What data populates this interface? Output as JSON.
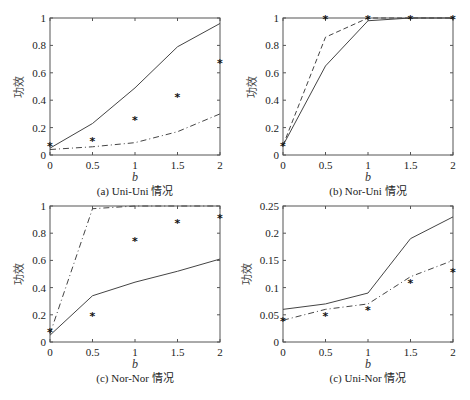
{
  "chart_data": [
    {
      "type": "line",
      "title": "(a) Uni-Uni 情况",
      "xlabel": "b",
      "ylabel": "功效",
      "xlim": [
        0,
        2
      ],
      "ylim": [
        0,
        1
      ],
      "xticks": [
        "0",
        "0.5",
        "1",
        "1.5",
        "2"
      ],
      "yticks": [
        "0",
        "0.2",
        "0.4",
        "0.6",
        "0.8",
        "1"
      ],
      "x": [
        0,
        0.5,
        1,
        1.5,
        2
      ],
      "series": [
        {
          "name": "solid",
          "style": "solid",
          "values": [
            0.05,
            0.23,
            0.49,
            0.79,
            0.96
          ]
        },
        {
          "name": "dash-dot",
          "style": "dashdot",
          "values": [
            0.04,
            0.06,
            0.09,
            0.17,
            0.3
          ]
        },
        {
          "name": "stars",
          "style": "marker",
          "values": [
            0.07,
            0.11,
            0.26,
            0.43,
            0.68
          ]
        }
      ]
    },
    {
      "type": "line",
      "title": "(b) Nor-Uni 情况",
      "xlabel": "b",
      "ylabel": "功效",
      "xlim": [
        0,
        2
      ],
      "ylim": [
        0,
        1
      ],
      "xticks": [
        "0",
        "0.5",
        "1",
        "1.5",
        "2"
      ],
      "yticks": [
        "0",
        "0.2",
        "0.4",
        "0.6",
        "0.8",
        "1"
      ],
      "x": [
        0,
        0.5,
        1,
        1.5,
        2
      ],
      "series": [
        {
          "name": "solid",
          "style": "solid",
          "values": [
            0.07,
            0.65,
            0.98,
            1.0,
            1.0
          ]
        },
        {
          "name": "dashed",
          "style": "dashed",
          "values": [
            0.07,
            0.86,
            1.0,
            1.0,
            1.0
          ]
        },
        {
          "name": "stars",
          "style": "marker",
          "values": [
            0.07,
            1.0,
            1.0,
            1.0,
            1.0
          ]
        }
      ]
    },
    {
      "type": "line",
      "title": "(c) Nor-Nor 情况",
      "xlabel": "b",
      "ylabel": "功效",
      "xlim": [
        0,
        2
      ],
      "ylim": [
        0,
        1
      ],
      "xticks": [
        "0",
        "0.5",
        "1",
        "1.5",
        "2"
      ],
      "yticks": [
        "0",
        "0.2",
        "0.4",
        "0.6",
        "0.8",
        "1"
      ],
      "x": [
        0,
        0.5,
        1,
        1.5,
        2
      ],
      "series": [
        {
          "name": "solid",
          "style": "solid",
          "values": [
            0.05,
            0.34,
            0.44,
            0.52,
            0.61
          ]
        },
        {
          "name": "dash-dot",
          "style": "dashdot",
          "values": [
            0.06,
            0.98,
            1.0,
            1.0,
            1.0
          ]
        },
        {
          "name": "stars",
          "style": "marker",
          "values": [
            0.08,
            0.2,
            0.75,
            0.88,
            0.92
          ]
        }
      ]
    },
    {
      "type": "line",
      "title": "(c) Uni-Nor 情况",
      "xlabel": "b",
      "ylabel": "功效",
      "xlim": [
        0,
        2
      ],
      "ylim": [
        0,
        0.25
      ],
      "xticks": [
        "0",
        "0.5",
        "1",
        "1.5",
        "2"
      ],
      "yticks": [
        "0",
        "0.05",
        "0.1",
        "0.15",
        "0.2",
        "0.25"
      ],
      "x": [
        0,
        0.5,
        1,
        1.5,
        2
      ],
      "series": [
        {
          "name": "solid",
          "style": "solid",
          "values": [
            0.06,
            0.07,
            0.09,
            0.19,
            0.23
          ]
        },
        {
          "name": "dash-dot",
          "style": "dashdot",
          "values": [
            0.04,
            0.06,
            0.07,
            0.12,
            0.15
          ]
        },
        {
          "name": "stars",
          "style": "marker",
          "values": [
            0.04,
            0.05,
            0.06,
            0.11,
            0.13
          ]
        }
      ]
    }
  ]
}
